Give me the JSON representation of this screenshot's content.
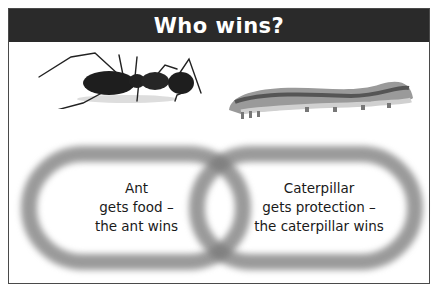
{
  "header": {
    "title": "Who wins?"
  },
  "images": [
    {
      "name": "ant",
      "description": "black ant side view"
    },
    {
      "name": "caterpillar",
      "description": "grey caterpillar side view"
    }
  ],
  "rings": [
    {
      "name": "ant-ring",
      "lines": [
        "Ant",
        "gets food –",
        "the ant wins"
      ]
    },
    {
      "name": "caterpillar-ring",
      "lines": [
        "Caterpillar",
        "gets protection –",
        "the caterpillar wins"
      ]
    }
  ],
  "colors": {
    "header_bg": "#2a2a2a",
    "header_text": "#ffffff",
    "ring": "#787878",
    "border": "#4a4a4a"
  }
}
